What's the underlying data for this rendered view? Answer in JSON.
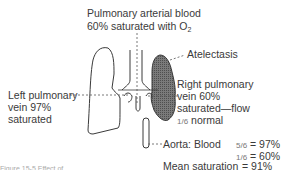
{
  "labels": {
    "pulmonary_arterial_line1": "Pulmonary arterial blood",
    "pulmonary_arterial_line2": "60% saturated with O",
    "pulmonary_arterial_sub": "2",
    "atelectasis": "Atelectasis",
    "right_vein_line1": "Right pulmonary",
    "right_vein_line2": "vein 60%",
    "right_vein_line3": "saturated—flow",
    "right_vein_frac": "1/6",
    "right_vein_line4": " normal",
    "left_vein_line1": "Left pulmonary",
    "left_vein_line2": "vein 97%",
    "left_vein_line3": "saturated",
    "aorta_label": "Aorta: Blood",
    "aorta_row1_frac": "5/6",
    "aorta_row1_value": "= 97%",
    "aorta_row2_frac": "1/6",
    "aorta_row2_value": "= 60%",
    "mean_label": "Mean saturation",
    "mean_value": "= 91%",
    "caption": "Figure 15-5 Effect of"
  },
  "colors": {
    "line": "#3a3a3a",
    "atelectasis_fill": "#6e6e6e"
  }
}
